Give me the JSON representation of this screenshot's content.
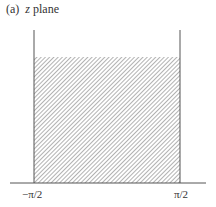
{
  "figure": {
    "panel_label": "(a)",
    "variable": "z",
    "title_suffix": "plane",
    "x_labels": {
      "left": "−π/2",
      "right": "π/2"
    },
    "region": "hatched semi-infinite strip between -π/2 and π/2 above the real axis"
  }
}
